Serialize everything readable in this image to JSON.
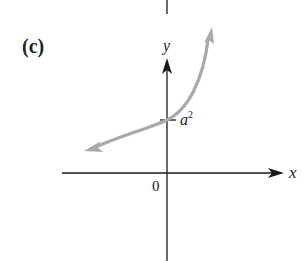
{
  "figure": {
    "panel_label": "(c)",
    "axes": {
      "x_label": "x",
      "y_label": "y",
      "origin_label": "0"
    },
    "y_intercept_label": {
      "base": "a",
      "exponent": "2"
    },
    "colors": {
      "axes": "#1a1a1a",
      "curve": "#a9a9a9",
      "background": "#ffffff"
    },
    "curve": {
      "description": "Exponential growth curve crossing y-axis at a^2, arrows at both ends",
      "y_intercept": "a^2"
    }
  }
}
